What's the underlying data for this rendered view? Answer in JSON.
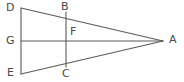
{
  "figure": {
    "title": "",
    "background_color": "#fefefe",
    "stroke_color": "#5a5a5a",
    "label_color": "#4a4a4a",
    "width": 184,
    "height": 82
  },
  "chart_data": {
    "type": "diagram",
    "subtype": "geometric-line-figure",
    "title": "",
    "xlabel": "",
    "ylabel": "",
    "grid": false,
    "legend": null,
    "xlim": [
      0,
      184
    ],
    "ylim": [
      0,
      82
    ],
    "points": [
      {
        "name": "D",
        "x": 21,
        "y": 8,
        "label": "D",
        "label_x": 6,
        "label_y": 2
      },
      {
        "name": "B",
        "x": 66,
        "y": 12,
        "label": "B",
        "label_x": 61,
        "label_y": 1
      },
      {
        "name": "A",
        "x": 163,
        "y": 41,
        "label": "A",
        "label_x": 169,
        "label_y": 34
      },
      {
        "name": "G",
        "x": 21,
        "y": 41,
        "label": "G",
        "label_x": 6,
        "label_y": 35
      },
      {
        "name": "F",
        "x": 66,
        "y": 41,
        "label": "F",
        "label_x": 70,
        "label_y": 26
      },
      {
        "name": "E",
        "x": 21,
        "y": 74,
        "label": "E",
        "label_x": 7,
        "label_y": 67
      },
      {
        "name": "C",
        "x": 66,
        "y": 67,
        "label": "C",
        "label_x": 62,
        "label_y": 68
      }
    ],
    "segments": [
      {
        "name": "segment-DE",
        "from": "D",
        "to": "E",
        "x1": 21,
        "y1": 8,
        "x2": 21,
        "y2": 74
      },
      {
        "name": "segment-DA",
        "from": "D",
        "to": "A",
        "x1": 21,
        "y1": 8,
        "x2": 163,
        "y2": 41
      },
      {
        "name": "segment-EA",
        "from": "E",
        "to": "A",
        "x1": 21,
        "y1": 74,
        "x2": 163,
        "y2": 41
      },
      {
        "name": "segment-GA",
        "from": "G",
        "to": "A",
        "x1": 21,
        "y1": 41,
        "x2": 163,
        "y2": 41
      },
      {
        "name": "segment-BC",
        "from": "B",
        "to": "C",
        "x1": 66,
        "y1": 12,
        "x2": 66,
        "y2": 67
      }
    ]
  },
  "labels": {
    "D": "D",
    "B": "B",
    "A": "A",
    "G": "G",
    "F": "F",
    "E": "E",
    "C": "C"
  }
}
